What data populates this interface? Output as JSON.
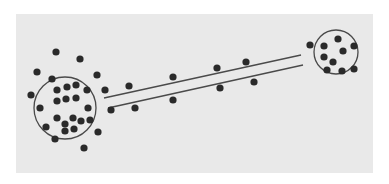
{
  "figure": {
    "colors": {
      "background": "#ffffff",
      "panel": "#e9e9e9",
      "dot": "#2a2a2a",
      "line": "#4a4a4a"
    },
    "left_cluster": {
      "circle": {
        "cx": 65,
        "cy": 108,
        "r": 31
      },
      "dots": [
        [
          56,
          52
        ],
        [
          80,
          59
        ],
        [
          37,
          72
        ],
        [
          52,
          79
        ],
        [
          97,
          75
        ],
        [
          31,
          95
        ],
        [
          40,
          108
        ],
        [
          46,
          127
        ],
        [
          55,
          139
        ],
        [
          84,
          148
        ],
        [
          98,
          132
        ],
        [
          105,
          90
        ],
        [
          111,
          110
        ],
        [
          57,
          90
        ],
        [
          67,
          87
        ],
        [
          76,
          85
        ],
        [
          87,
          90
        ],
        [
          57,
          101
        ],
        [
          66,
          99
        ],
        [
          76,
          98
        ],
        [
          88,
          108
        ],
        [
          57,
          118
        ],
        [
          65,
          124
        ],
        [
          73,
          118
        ],
        [
          81,
          121
        ],
        [
          90,
          120
        ],
        [
          65,
          131
        ],
        [
          74,
          129
        ]
      ]
    },
    "right_cluster": {
      "circle": {
        "cx": 336,
        "cy": 52,
        "r": 22
      },
      "dots": [
        [
          310,
          45
        ],
        [
          324,
          46
        ],
        [
          338,
          39
        ],
        [
          343,
          51
        ],
        [
          354,
          46
        ],
        [
          324,
          57
        ],
        [
          333,
          62
        ],
        [
          327,
          70
        ],
        [
          342,
          71
        ],
        [
          354,
          69
        ]
      ]
    },
    "channel": {
      "upper_line": {
        "x1": 104,
        "y1": 98,
        "x2": 301,
        "y2": 55
      },
      "lower_line": {
        "x1": 108,
        "y1": 108,
        "x2": 303,
        "y2": 65
      }
    },
    "channel_dots": [
      [
        129,
        86
      ],
      [
        135,
        108
      ],
      [
        173,
        77
      ],
      [
        173,
        100
      ],
      [
        217,
        68
      ],
      [
        220,
        88
      ],
      [
        246,
        62
      ],
      [
        254,
        82
      ]
    ]
  }
}
